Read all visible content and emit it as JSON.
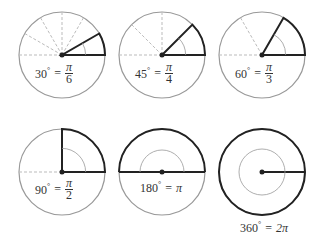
{
  "diagrams": [
    {
      "degrees": "30",
      "num": "π",
      "den": "6",
      "angle": 30,
      "cx": 62,
      "cy": 55
    },
    {
      "degrees": "45",
      "num": "π",
      "den": "4",
      "angle": 45,
      "cx": 162,
      "cy": 55
    },
    {
      "degrees": "60",
      "num": "π",
      "den": "3",
      "angle": 60,
      "cx": 262,
      "cy": 55
    },
    {
      "degrees": "90",
      "num": "π",
      "den": "2",
      "angle": 90,
      "cx": 62,
      "cy": 172
    },
    {
      "degrees": "180",
      "rad": "π",
      "angle": 180,
      "cx": 162,
      "cy": 172
    },
    {
      "degrees": "360",
      "rad": "2π",
      "angle": 360,
      "cx": 262,
      "cy": 172
    }
  ],
  "labels": {
    "l30": {
      "deg": "30",
      "eq": "=",
      "num": "π",
      "den": "6"
    },
    "l45": {
      "deg": "45",
      "eq": "=",
      "num": "π",
      "den": "4"
    },
    "l60": {
      "deg": "60",
      "eq": "=",
      "num": "π",
      "den": "3"
    },
    "l90": {
      "deg": "90",
      "eq": "=",
      "num": "π",
      "den": "2"
    },
    "l180": {
      "deg": "180",
      "eq": "=",
      "rad": "π"
    },
    "l360": {
      "deg": "360",
      "eq": "=",
      "rad": "2π"
    }
  },
  "colors": {
    "circle": "#999999",
    "bold": "#222222",
    "dashed": "#bbbbbb"
  }
}
